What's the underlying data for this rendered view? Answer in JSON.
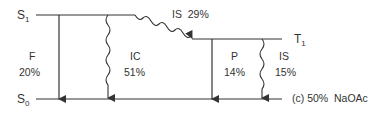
{
  "levels": {
    "s1": {
      "main": "S",
      "sub": "1"
    },
    "s0": {
      "main": "S",
      "sub": "0"
    },
    "t1": {
      "main": "T",
      "sub": "1"
    }
  },
  "transitions": {
    "fluorescence": {
      "label": "F",
      "value": "20%"
    },
    "internal_conversion": {
      "label": "IC",
      "value": "51%"
    },
    "intersystem_s1_t1": {
      "label": "IS",
      "value": "29%"
    },
    "phosphorescence": {
      "label": "P",
      "value": "14%"
    },
    "intersystem_t1_s0": {
      "label": "IS",
      "value": "15%"
    }
  },
  "caption": "(c) 50%  NaOAc",
  "colors": {
    "line": "#333333"
  }
}
